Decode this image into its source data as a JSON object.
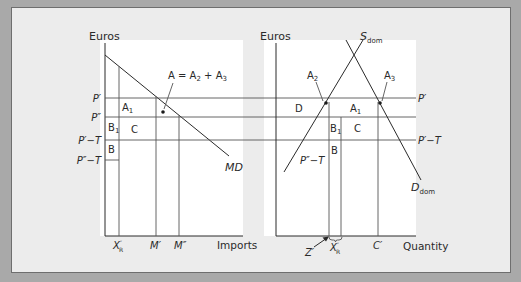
{
  "figure": {
    "colors": {
      "outer_background": "#a9a9a9",
      "panel_background": "#ececec",
      "plot_background": "#ffffff",
      "line_color": "#2a2a2a"
    },
    "left_panel": {
      "y_axis_label": "Euros",
      "x_axis_label": "Imports",
      "price_labels": [
        "P′",
        "P″",
        "P′−T",
        "P″−T"
      ],
      "quantity_labels": {
        "xr": "X",
        "xr_sup": "″",
        "xr_sub": "R",
        "m1": "M′",
        "m2": "M″"
      },
      "curve_label": "MD",
      "area_labels": {
        "a1": "A",
        "a1_sub": "1",
        "b1": "B",
        "b1_sub": "1",
        "c": "C",
        "b": "B"
      },
      "annotation": {
        "lhs": "A = A",
        "sub2": "2",
        "plus": " + A",
        "sub3": "3"
      }
    },
    "right_panel": {
      "y_axis_label": "Euros",
      "x_axis_label": "Quantity",
      "supply_label": "S",
      "supply_sub": "dom",
      "demand_label": "D",
      "demand_sub": "dom",
      "price_labels_right": [
        "P′",
        "P′−T"
      ],
      "inner_price_label": "P″−T",
      "quantity_labels": {
        "z": "Z′",
        "xr": "X",
        "xr_sup": "″",
        "xr_sub": "R",
        "c1": "C′"
      },
      "area_labels": {
        "d": "D",
        "a1": "A",
        "a1_sub": "1",
        "b1": "B",
        "b1_sub": "1",
        "c": "C",
        "b": "B",
        "a2": "A",
        "a2_sub": "2",
        "a3": "A",
        "a3_sub": "3"
      }
    }
  }
}
